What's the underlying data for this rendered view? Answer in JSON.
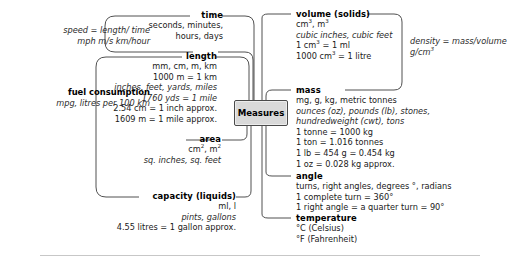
{
  "center": {
    "label": "Measures"
  },
  "left_notes": [
    {
      "name": "speed-note",
      "lines": [
        "speed = length/ time",
        "mph m/s km/hour"
      ]
    },
    {
      "name": "fuel-note",
      "heading": "fuel consumption",
      "lines": [
        "mpg, litres per 100 km"
      ]
    }
  ],
  "right_notes": [
    {
      "name": "density-note",
      "lines": [
        "density = mass/volume",
        "g/cm3"
      ]
    }
  ],
  "branches": [
    {
      "id": "time",
      "title": "time",
      "side": "left",
      "lines": [
        {
          "text": "seconds, minutes,",
          "style": "normal"
        },
        {
          "text": "hours, days",
          "style": "normal"
        }
      ]
    },
    {
      "id": "length",
      "title": "length",
      "side": "left",
      "lines": [
        {
          "text": "mm, cm, m, km",
          "style": "normal"
        },
        {
          "text": "1000 m = 1 km",
          "style": "normal"
        },
        {
          "text": "inches, feet, yards, miles",
          "style": "italic"
        },
        {
          "text": "1760 yds = 1 mile",
          "style": "italic"
        },
        {
          "text": "2.54 cm = 1 inch approx.",
          "style": "normal"
        },
        {
          "text": "1609 m = 1 mile approx.",
          "style": "normal"
        }
      ]
    },
    {
      "id": "area",
      "title": "area",
      "side": "left",
      "lines": [
        {
          "text": "cm2, m2",
          "style": "normal"
        },
        {
          "text": "sq. inches, sq. feet",
          "style": "italic"
        }
      ]
    },
    {
      "id": "capacity",
      "title": "capacity (liquids)",
      "side": "left",
      "lines": [
        {
          "text": "ml, l",
          "style": "normal"
        },
        {
          "text": "pints, gallons",
          "style": "italic"
        },
        {
          "text": "4.55 litres = 1 gallon approx.",
          "style": "normal"
        }
      ]
    },
    {
      "id": "volume",
      "title": "volume (solids)",
      "side": "right",
      "lines": [
        {
          "text": "cm3, m3",
          "style": "normal"
        },
        {
          "text": "cubic inches, cubic feet",
          "style": "italic"
        },
        {
          "text": "1 cm3 = 1 ml",
          "style": "normal"
        },
        {
          "text": "1000 cm3 = 1 litre",
          "style": "normal"
        }
      ]
    },
    {
      "id": "mass",
      "title": "mass",
      "side": "right",
      "lines": [
        {
          "text": "mg, g, kg, metric tonnes",
          "style": "normal"
        },
        {
          "text": "ounces (oz), pounds (lb), stones,",
          "style": "italic"
        },
        {
          "text": "hundredweight (cwt), tons",
          "style": "italic"
        },
        {
          "text": "1 tonne = 1000 kg",
          "style": "normal"
        },
        {
          "text": "1 ton = 1.016 tonnes",
          "style": "normal"
        },
        {
          "text": "1 lb = 454 g = 0.454 kg",
          "style": "normal"
        },
        {
          "text": "1 oz = 0.028 kg approx.",
          "style": "normal"
        }
      ]
    },
    {
      "id": "angle",
      "title": "angle",
      "side": "right",
      "lines": [
        {
          "text": "turns, right angles, degrees °, radians",
          "style": "normal"
        },
        {
          "text": "1 complete turn = 360°",
          "style": "normal"
        },
        {
          "text": "1 right angle = a quarter turn = 90°",
          "style": "normal"
        }
      ]
    },
    {
      "id": "temperature",
      "title": "temperature",
      "side": "right",
      "lines": [
        {
          "text": "°C (Celsius)",
          "style": "normal"
        },
        {
          "text": "°F (Fahrenheit)",
          "style": "normal"
        }
      ]
    }
  ],
  "colors": {
    "center_fill": "#d9d9d9",
    "stroke": "#3c3c3c",
    "text": "#1a1a1a",
    "rule": "#c7c7c7"
  }
}
